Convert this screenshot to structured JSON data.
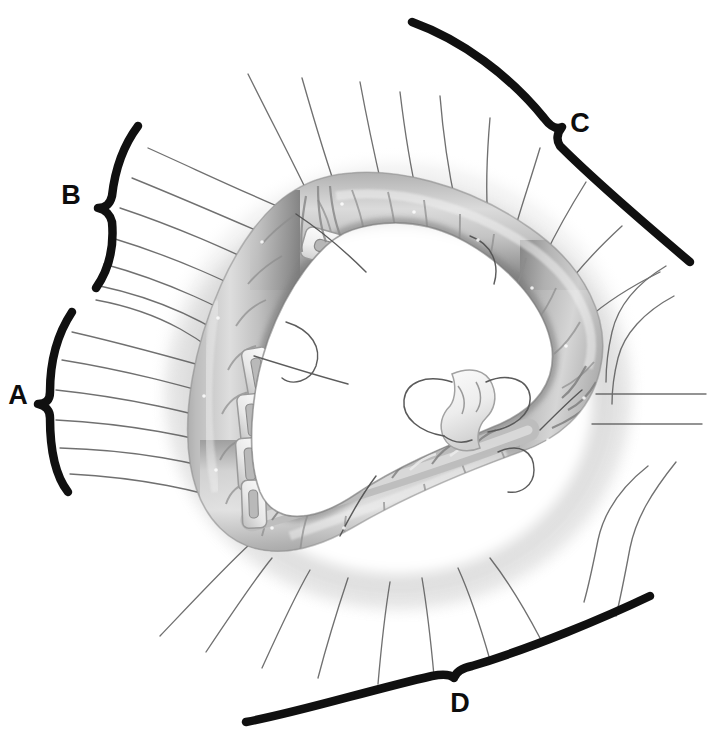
{
  "figure": {
    "background_color": "#ffffff",
    "ink_color": "#111111",
    "suture_color": "#5a5a5a",
    "tissue_mid": "#a9a9a9",
    "tissue_dark": "#6f6f6f",
    "tissue_light": "#e4e4e4",
    "width": 710,
    "height": 738
  },
  "labels": {
    "a": "A",
    "b": "B",
    "c": "C",
    "d": "D"
  },
  "brackets": [
    {
      "id": "bracket-a",
      "label": "A",
      "label_x": 18,
      "label_y": 404,
      "side": "left"
    },
    {
      "id": "bracket-b",
      "label": "B",
      "label_x": 71,
      "label_y": 204,
      "side": "left"
    },
    {
      "id": "bracket-c",
      "label": "C",
      "label_x": 572,
      "label_y": 130,
      "side": "right"
    },
    {
      "id": "bracket-d",
      "label": "D",
      "label_x": 458,
      "label_y": 707,
      "side": "bottom"
    }
  ],
  "annulus": {
    "shape": "rounded-triangle",
    "segment_count": 3,
    "center_x": 398,
    "center_y": 382
  },
  "sutures": {
    "total": 31,
    "groups": [
      {
        "group": "A",
        "count": 6
      },
      {
        "group": "B",
        "count": 7
      },
      {
        "group": "C",
        "count": 10
      },
      {
        "group": "D",
        "count": 8
      }
    ]
  },
  "center_element": {
    "name": "free-pledget-suture",
    "x": 470,
    "y": 410
  }
}
